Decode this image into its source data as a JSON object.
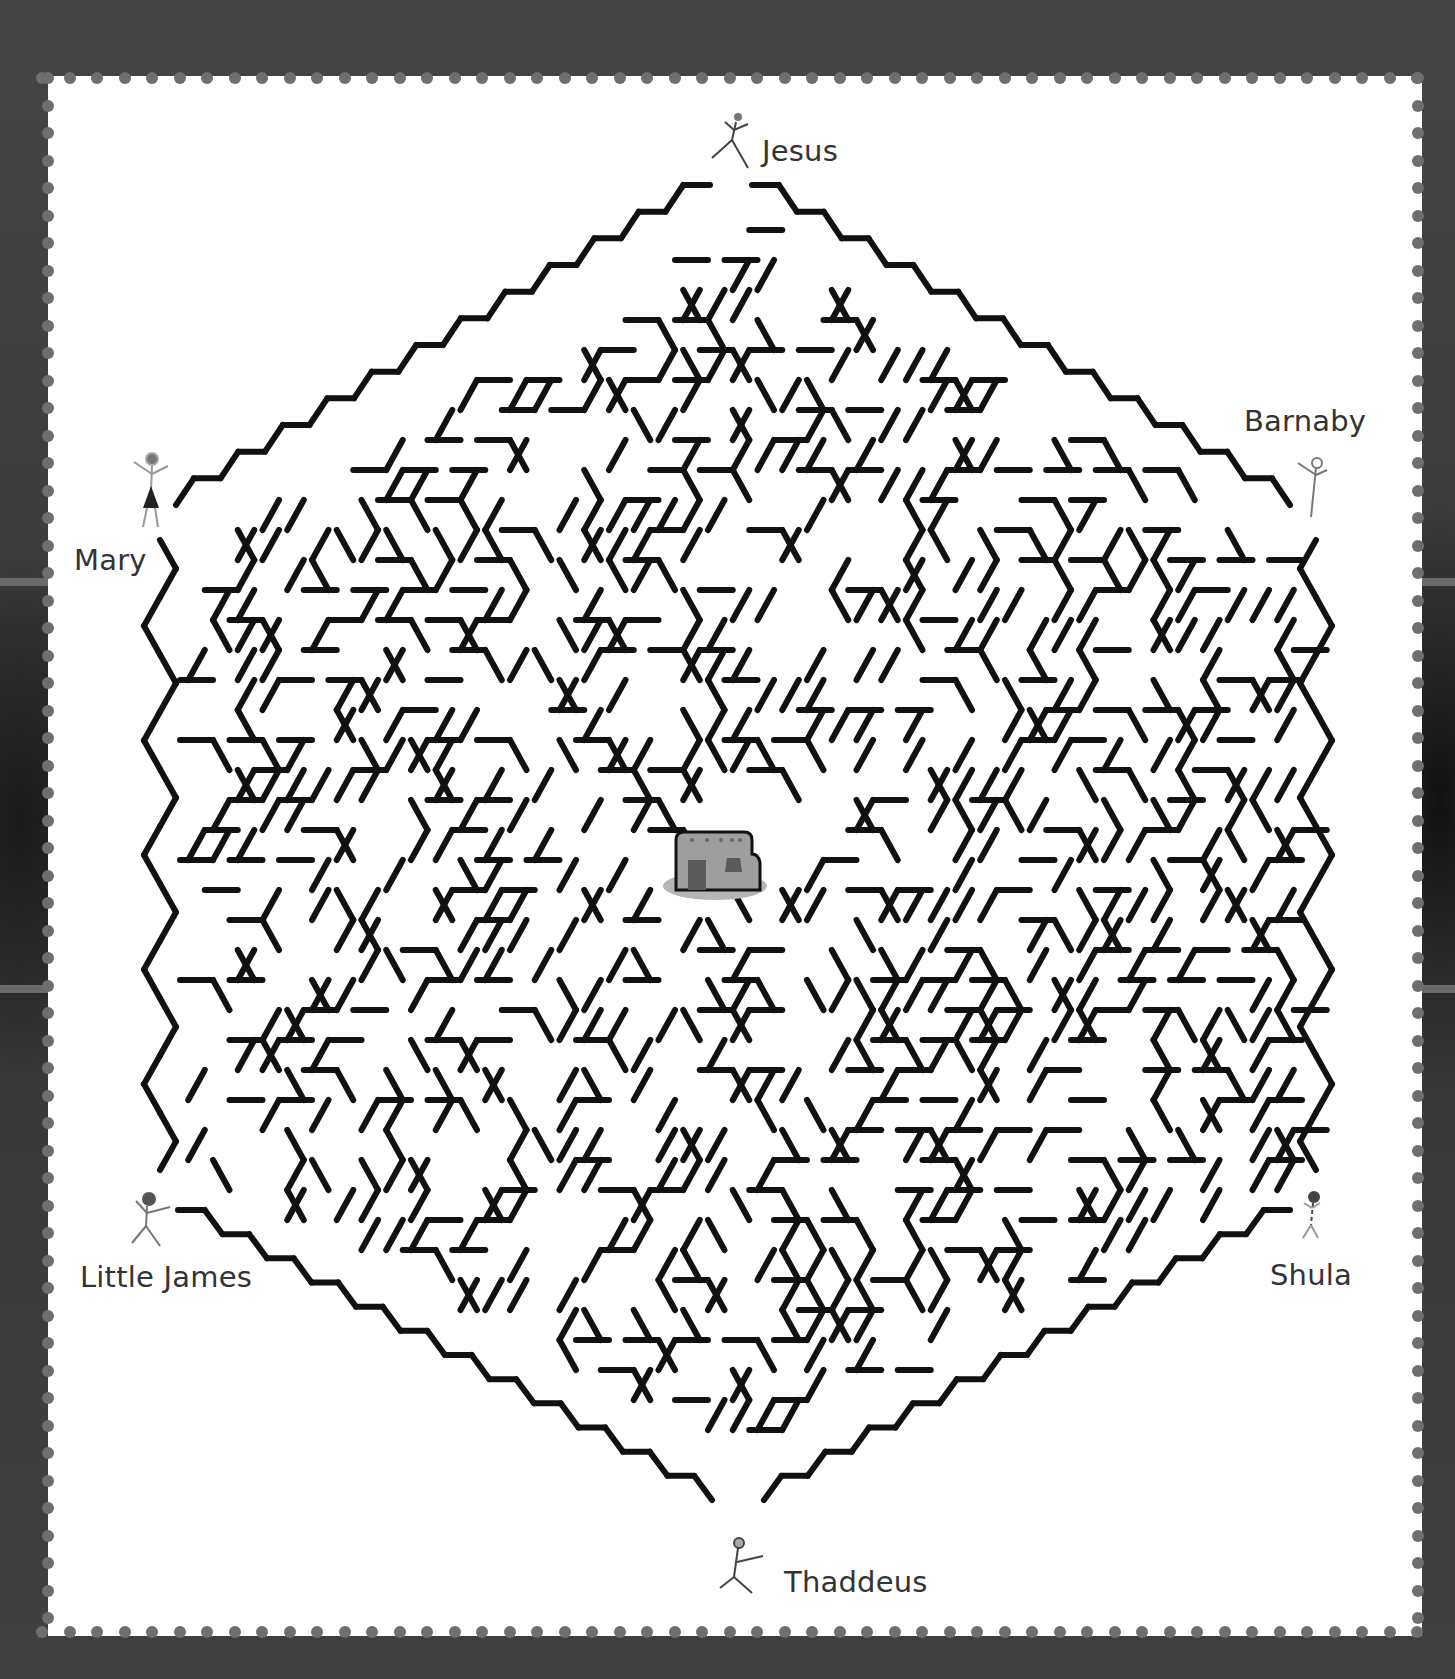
{
  "puzzle": {
    "type": "hexagonal maze",
    "goal": "house-icon",
    "colors": {
      "wall": "#111111",
      "paper": "#ffffff",
      "frame": "#3c3c3c",
      "perforation": "#6e6e6e",
      "label_text": "#333333",
      "house_wall": "#9e9e9e",
      "house_door": "#5a5a5a",
      "house_shadow": "#b5b5b5"
    }
  },
  "characters": [
    {
      "id": "jesus",
      "name": "Jesus",
      "position": "top"
    },
    {
      "id": "barnaby",
      "name": "Barnaby",
      "position": "upper-right"
    },
    {
      "id": "mary",
      "name": "Mary",
      "position": "upper-left"
    },
    {
      "id": "little-james",
      "name": "Little James",
      "position": "lower-left"
    },
    {
      "id": "shula",
      "name": "Shula",
      "position": "lower-right"
    },
    {
      "id": "thaddeus",
      "name": "Thaddeus",
      "position": "bottom"
    }
  ],
  "center": {
    "icon": "adobe-house"
  },
  "grid": {
    "seg": 33,
    "dx": 16.5,
    "dy": 30,
    "seed": 7
  }
}
